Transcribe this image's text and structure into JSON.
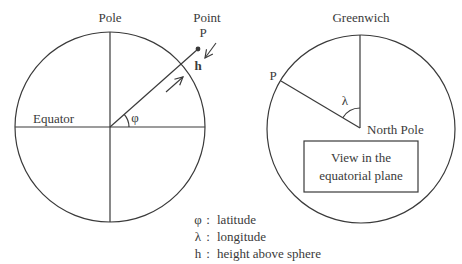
{
  "left_diagram": {
    "pole_label": "Pole",
    "point_label_line1": "Point",
    "point_label_line2": "P",
    "height_label": "h",
    "equator_label": "Equator",
    "latitude_symbol": "φ"
  },
  "right_diagram": {
    "greenwich_label": "Greenwich",
    "point_label": "P",
    "longitude_symbol": "λ",
    "north_pole_label": "North Pole",
    "box_line1": "View in the",
    "box_line2": "equatorial plane"
  },
  "legend": {
    "items": [
      {
        "symbol": "φ",
        "sep": ":",
        "text": "latitude"
      },
      {
        "symbol": "λ",
        "sep": ":",
        "text": "longitude"
      },
      {
        "symbol": "h",
        "sep": ":",
        "text": "height above sphere"
      }
    ]
  },
  "colors": {
    "stroke": "#3a3a3a",
    "background": "#ffffff"
  }
}
